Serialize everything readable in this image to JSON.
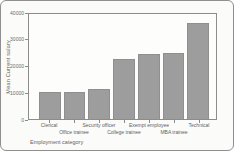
{
  "chart_data": {
    "type": "bar",
    "title": "",
    "xlabel": "Employment category",
    "ylabel": "Mean Current salary",
    "categories": [
      "Clerical",
      "Office trainee",
      "Security officer",
      "College trainee",
      "Exempt employee",
      "MBA trainee",
      "Technical"
    ],
    "values": [
      10300,
      10300,
      11600,
      22800,
      24700,
      25100,
      36500
    ],
    "ylim": [
      0,
      40000
    ],
    "yticks": [
      0,
      10000,
      20000,
      30000,
      40000
    ],
    "ytick_labels": [
      "0",
      "10000",
      "20000",
      "30000",
      "40000"
    ],
    "bar_color": "#9d9d9d",
    "grid": false,
    "legend_position": "none",
    "label_layout": "staggered-two-rows"
  }
}
